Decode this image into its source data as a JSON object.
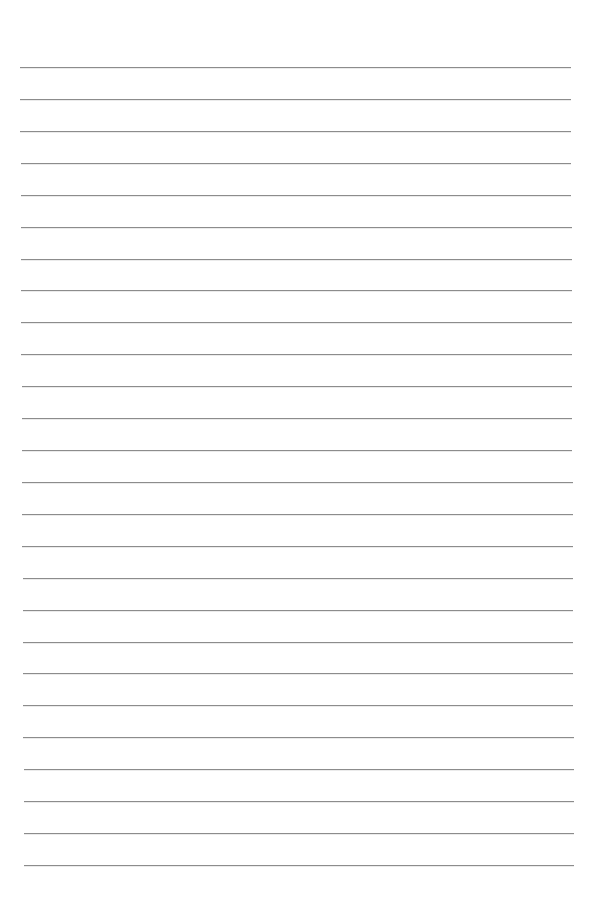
{
  "page": {
    "type": "ruled-paper",
    "background": "#ffffff",
    "line_color": "#8c8c8c",
    "line_count": 26,
    "first_line_y": 67,
    "line_spacing": 31.92,
    "line_left_top": 20,
    "line_left_bottom": 24,
    "line_right_top": 571,
    "line_right_bottom": 574,
    "text": []
  }
}
